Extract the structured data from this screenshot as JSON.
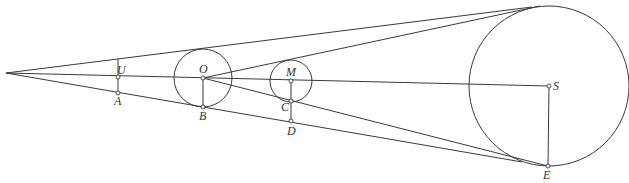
{
  "diagram": {
    "type": "geometry",
    "stroke_color": "#3a3a3a",
    "background": "#ffffff",
    "apex": {
      "x": 6,
      "y": 73
    },
    "circles": [
      {
        "id": "O",
        "cx": 203,
        "cy": 78,
        "r": 29
      },
      {
        "id": "M",
        "cx": 291,
        "cy": 81,
        "r": 21
      },
      {
        "id": "S",
        "cx": 549,
        "cy": 86,
        "r": 80
      }
    ],
    "points": [
      {
        "id": "U",
        "label": "U",
        "x": 118,
        "y": 77
      },
      {
        "id": "A",
        "label": "A",
        "x": 118,
        "y": 93
      },
      {
        "id": "O",
        "label": "O",
        "x": 203,
        "y": 78
      },
      {
        "id": "B",
        "label": "B",
        "x": 203,
        "y": 107
      },
      {
        "id": "M",
        "label": "M",
        "x": 291,
        "y": 81
      },
      {
        "id": "C",
        "label": "C",
        "x": 291,
        "y": 101
      },
      {
        "id": "D",
        "label": "D",
        "x": 291,
        "y": 121
      },
      {
        "id": "S",
        "label": "S",
        "x": 549,
        "y": 86
      },
      {
        "id": "E",
        "label": "E",
        "x": 548,
        "y": 166
      }
    ],
    "labels": {
      "U": "U",
      "A": "A",
      "O": "O",
      "B": "B",
      "M": "M",
      "C": "C",
      "D": "D",
      "S": "S",
      "E": "E"
    }
  }
}
